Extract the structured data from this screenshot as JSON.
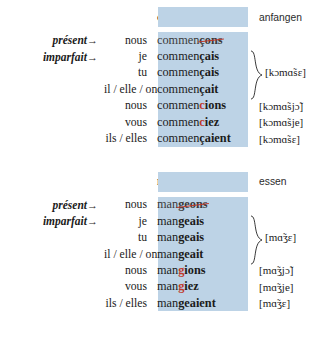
{
  "tables": [
    {
      "id": "commencer",
      "verb": "commencer",
      "gloss": "anfangen",
      "tense_labels": {
        "present": "présent",
        "imparfait": "imparfait",
        "arrow": "→"
      },
      "rows": [
        {
          "pronoun": "nous",
          "stem": "commen",
          "ending": "çons",
          "style": "struck",
          "ipa": ""
        },
        {
          "pronoun": "je",
          "stem": "commen",
          "ending": "çais",
          "style": "bold",
          "ipa": ""
        },
        {
          "pronoun": "tu",
          "stem": "commen",
          "ending": "çais",
          "style": "bold",
          "ipa": ""
        },
        {
          "pronoun": "il / elle / on",
          "stem": "commen",
          "ending": "çait",
          "style": "bold",
          "ipa": ""
        },
        {
          "pronoun": "nous",
          "stem": "commen",
          "red": "c",
          "ending": "ions",
          "style": "red-bold",
          "ipa": "[kɔmɑ̃sjɔ̃]"
        },
        {
          "pronoun": "vous",
          "stem": "commen",
          "red": "c",
          "ending": "iez",
          "style": "red-bold",
          "ipa": "[kɔmɑ̃sje]"
        },
        {
          "pronoun": "ils / elles",
          "stem": "commen",
          "ending": "çaient",
          "style": "bold",
          "ipa": "[kɔmɑ̃sɛ]"
        }
      ],
      "brace_ipa": "[kɔmɑ̃sɛ]"
    },
    {
      "id": "manger",
      "verb": "manger",
      "gloss": "essen",
      "tense_labels": {
        "present": "présent",
        "imparfait": "imparfait",
        "arrow": "→"
      },
      "rows": [
        {
          "pronoun": "nous",
          "stem": "man",
          "ending": "geons",
          "style": "struck",
          "ipa": ""
        },
        {
          "pronoun": "je",
          "stem": "man",
          "ending": "geais",
          "style": "bold",
          "ipa": ""
        },
        {
          "pronoun": "tu",
          "stem": "man",
          "ending": "geais",
          "style": "bold",
          "ipa": ""
        },
        {
          "pronoun": "il / elle / on",
          "stem": "man",
          "ending": "geait",
          "style": "bold",
          "ipa": ""
        },
        {
          "pronoun": "nous",
          "stem": "man",
          "red": "g",
          "ending": "ions",
          "style": "red-bold",
          "ipa": "[mɑ̃ʒjɔ̃]"
        },
        {
          "pronoun": "vous",
          "stem": "man",
          "red": "g",
          "ending": "iez",
          "style": "red-bold",
          "ipa": "[mɑ̃ʒje]"
        },
        {
          "pronoun": "ils / elles",
          "stem": "man",
          "ending": "geaient",
          "style": "bold",
          "ipa": "[mɑ̃ʒɛ]"
        }
      ],
      "brace_ipa": "[mɑ̃ʒɛ]"
    }
  ],
  "colors": {
    "highlight": "#bdd3e6",
    "accent_red": "#c0392b",
    "text": "#1b1b1b"
  }
}
